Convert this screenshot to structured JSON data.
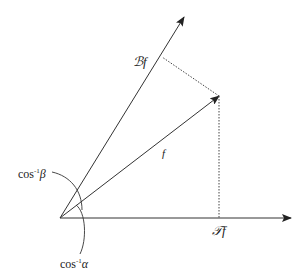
{
  "diagram": {
    "title": "",
    "colors": {
      "line": "#333333",
      "text": "#222222",
      "background": "#ffffff"
    },
    "origin": {
      "x": 60,
      "y": 218
    },
    "vectors": [
      {
        "id": "B-axis",
        "label": "",
        "tip": {
          "x": 184,
          "y": 17
        }
      },
      {
        "id": "f-vector",
        "label": "f",
        "tip": {
          "x": 219,
          "y": 96
        }
      },
      {
        "id": "T-axis",
        "label": "",
        "tip": {
          "x": 291,
          "y": 218
        }
      }
    ],
    "labels": {
      "Bf": "ℬf",
      "f": "f",
      "Tf": "𝒯f",
      "cos_beta_base": "cos",
      "cos_beta_sup": "-1",
      "cos_beta_sym": "β",
      "cos_alpha_base": "cos",
      "cos_alpha_sup": "-1",
      "cos_alpha_sym": "α"
    },
    "projections": [
      {
        "from": {
          "x": 219,
          "y": 96
        },
        "to": {
          "x": 137,
          "y": 57
        },
        "style": "dotted"
      },
      {
        "from": {
          "x": 219,
          "y": 96
        },
        "to": {
          "x": 219,
          "y": 218
        },
        "style": "dotted"
      }
    ]
  }
}
